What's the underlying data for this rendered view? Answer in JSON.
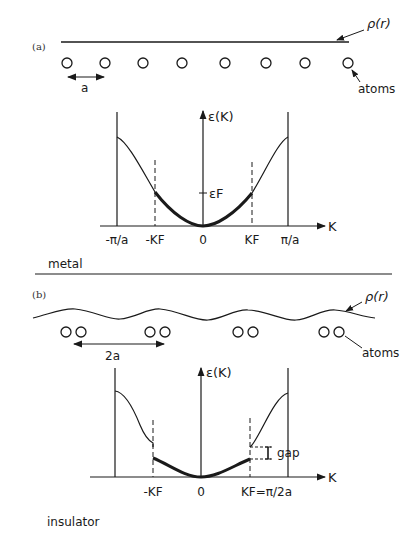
{
  "panel_a": {
    "label": "(a)",
    "density_label": "ρ(r)",
    "atoms_label": "atoms",
    "spacing_label": "a",
    "axis_y_label": "ε(K)",
    "axis_x_label": "K",
    "fermi_level_label": "εF",
    "ticks": [
      "-π/a",
      "-KF",
      "0",
      "KF",
      "π/a"
    ],
    "material_label": "metal"
  },
  "panel_b": {
    "label": "(b)",
    "density_label": "ρ(r)",
    "atoms_label": "atoms",
    "spacing_label": "2a",
    "axis_y_label": "ε(K)",
    "axis_x_label": "K",
    "gap_label": "gap",
    "ticks": [
      "-KF",
      "0",
      "KF=π/2a"
    ],
    "material_label": "insulator"
  }
}
